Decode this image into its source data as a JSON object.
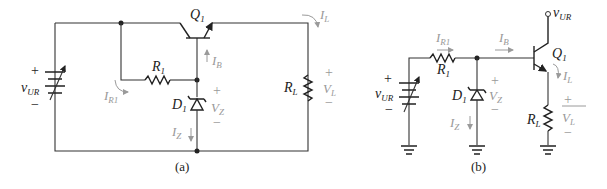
{
  "figure": {
    "panel_a": {
      "caption": "(a)",
      "transistor": {
        "name": "Q",
        "sub": "1"
      },
      "resistor": {
        "name": "R",
        "sub": "1"
      },
      "zener": {
        "name": "D",
        "sub": "1"
      },
      "load": {
        "name": "R",
        "sub": "L"
      },
      "source": {
        "name": "v",
        "sub": "UR",
        "plus": "+",
        "minus": "−"
      },
      "currents": {
        "ir1": {
          "name": "I",
          "sub": "R1"
        },
        "ib": {
          "name": "I",
          "sub": "B"
        },
        "iz": {
          "name": "I",
          "sub": "Z"
        },
        "il": {
          "name": "I",
          "sub": "L"
        }
      },
      "voltages": {
        "vz": {
          "name": "V",
          "sub": "Z",
          "plus": "+",
          "minus": "−"
        },
        "vl": {
          "name": "V",
          "sub": "L",
          "plus": "+",
          "minus": "−"
        }
      }
    },
    "panel_b": {
      "caption": "(b)",
      "transistor": {
        "name": "Q",
        "sub": "1"
      },
      "resistor": {
        "name": "R",
        "sub": "1"
      },
      "zener": {
        "name": "D",
        "sub": "1"
      },
      "load": {
        "name": "R",
        "sub": "L"
      },
      "source": {
        "name": "v",
        "sub": "UR",
        "plus": "+",
        "minus": "−"
      },
      "supply_terminal": {
        "name": "v",
        "sub": "UR"
      },
      "currents": {
        "ir1": {
          "name": "I",
          "sub": "R1"
        },
        "ib": {
          "name": "I",
          "sub": "B"
        },
        "iz": {
          "name": "I",
          "sub": "Z"
        },
        "il": {
          "name": "I",
          "sub": "L"
        }
      },
      "voltages": {
        "vz": {
          "name": "V",
          "sub": "Z",
          "plus": "+",
          "minus": "−"
        },
        "vl": {
          "name": "V",
          "sub": "L",
          "plus": "+",
          "minus": "−"
        }
      }
    }
  }
}
